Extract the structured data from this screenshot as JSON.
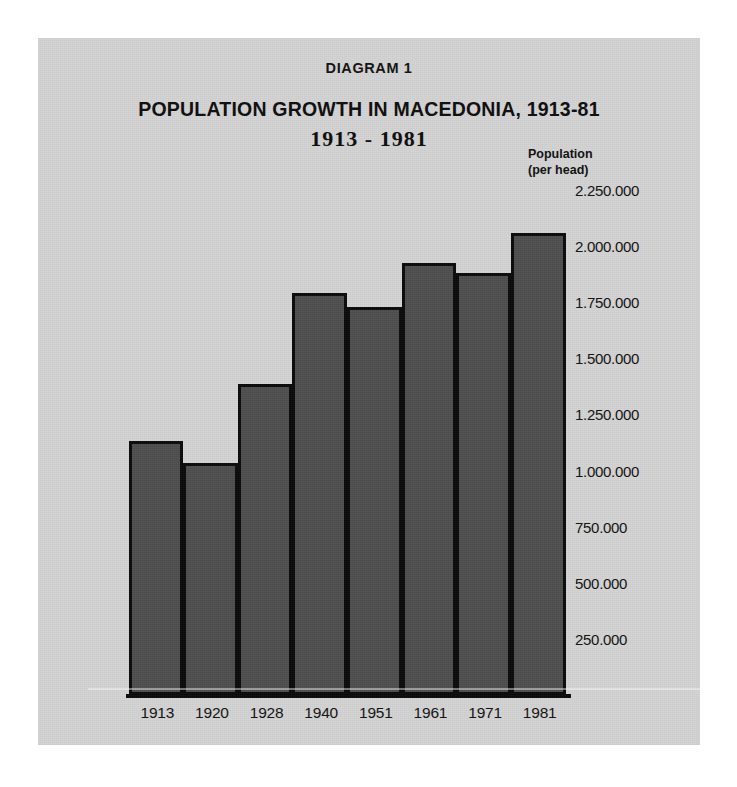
{
  "header": {
    "diagram_label": "DIAGRAM 1",
    "title": "POPULATION GROWTH IN MACEDONIA, 1913-81",
    "subtitle": "1913 - 1981"
  },
  "yaxis_caption": {
    "line1": "Population",
    "line2": "(per head)"
  },
  "colors": {
    "page_background": "#d4d4d4",
    "outer_background": "#ffffff",
    "bar_fill": "#4f4f4f",
    "bar_outline": "#0a0a0a",
    "text": "#111111"
  },
  "chart_data": {
    "type": "bar",
    "title": "POPULATION GROWTH IN MACEDONIA, 1913-81",
    "subtitle": "1913 - 1981",
    "xlabel": "",
    "ylabel": "Population (per head)",
    "ylim": [
      0,
      2250000
    ],
    "grid": false,
    "legend": null,
    "categories": [
      "1913",
      "1920",
      "1928",
      "1940",
      "1951",
      "1961",
      "1971",
      "1981"
    ],
    "values": [
      1133000,
      1035000,
      1385000,
      1792000,
      1730000,
      1925000,
      1880000,
      2058000
    ],
    "tick_values": [
      2250000,
      2000000,
      1750000,
      1500000,
      1250000,
      1000000,
      750000,
      500000,
      250000
    ],
    "tick_labels": [
      "2.250.000",
      "2.000.000",
      "1.750.000",
      "1.500.000",
      "1.250.000",
      "1.000.000",
      "750.000",
      "500.000",
      "250.000"
    ]
  }
}
